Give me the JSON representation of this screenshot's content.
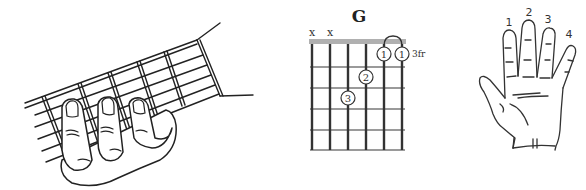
{
  "chord": {
    "name": "G",
    "position_label": "3fr",
    "strings": 6,
    "frets_shown": 5,
    "muted_strings": [
      1,
      2
    ],
    "muted_symbol": "x",
    "fingering": [
      {
        "string": 5,
        "fret": 1,
        "finger": "1"
      },
      {
        "string": 6,
        "fret": 1,
        "finger": "1"
      },
      {
        "string": 4,
        "fret": 2,
        "finger": "2"
      },
      {
        "string": 3,
        "fret": 3,
        "finger": "3"
      }
    ],
    "barre": {
      "from_string": 5,
      "to_string": 6,
      "fret": 1,
      "finger": "1"
    },
    "colors": {
      "string": "#333333",
      "fret": "#9a9a9a",
      "nut": "#b0b0b0"
    }
  },
  "fretting_hand_illustration": {
    "description": "Left hand fretting a guitar neck with three fingers"
  },
  "finger_numbering": {
    "labels": [
      "1",
      "2",
      "3",
      "4"
    ]
  }
}
